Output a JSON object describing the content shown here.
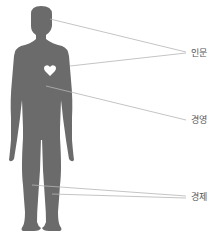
{
  "diagram": {
    "figure": "human-silhouette",
    "figure_color": "#6b6b6b",
    "line_color": "#b5b5b5",
    "heart_color": "#ffffff",
    "labels": [
      {
        "text": "인문",
        "points_to": [
          "head",
          "heart"
        ]
      },
      {
        "text": "경영",
        "points_to": [
          "torso"
        ]
      },
      {
        "text": "경제",
        "points_to": [
          "left-leg",
          "right-leg"
        ]
      }
    ]
  }
}
